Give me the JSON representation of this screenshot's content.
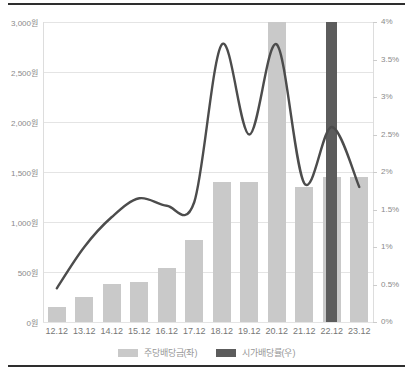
{
  "chart_data": {
    "type": "bar+line",
    "title": "",
    "categories": [
      "12.12",
      "13.12",
      "14.12",
      "15.12",
      "16.12",
      "17.12",
      "18.12",
      "19.12",
      "20.12",
      "21.12",
      "22.12",
      "23.12"
    ],
    "series": [
      {
        "name": "주당배당금(좌)",
        "type": "bar",
        "axis": "left",
        "unit": "원",
        "color": "#c9c9c9",
        "values": [
          150,
          250,
          380,
          400,
          540,
          820,
          1400,
          1400,
          3000,
          1350,
          1450,
          1450
        ]
      },
      {
        "name": "시가배당률(우)",
        "type": "line",
        "axis": "right",
        "unit": "%",
        "color": "#4c4c4c",
        "values": [
          0.45,
          1.0,
          1.4,
          1.65,
          1.55,
          1.6,
          3.7,
          2.5,
          3.7,
          1.85,
          2.6,
          1.8
        ]
      }
    ],
    "highlight": {
      "category": "22.12",
      "color": "#5c5c5c",
      "full_height": true
    },
    "left_axis": {
      "min": 0,
      "max": 3000,
      "step": 500,
      "tick_labels": [
        "3,000원",
        "2,500원",
        "2,000원",
        "1,500원",
        "1,000원",
        "500원",
        "0원"
      ]
    },
    "right_axis": {
      "min": 0,
      "max": 4,
      "step": 0.5,
      "tick_labels": [
        "4%",
        "3.5%",
        "3%",
        "2.5%",
        "2%",
        "1.5%",
        "1%",
        "0.5%",
        "0%"
      ]
    },
    "grid": "horizontal-only",
    "legend": [
      {
        "label": "주당배당금(좌)",
        "color": "#c9c9c9"
      },
      {
        "label": "시가배당률(우)",
        "color": "#5c5c5c"
      }
    ]
  }
}
